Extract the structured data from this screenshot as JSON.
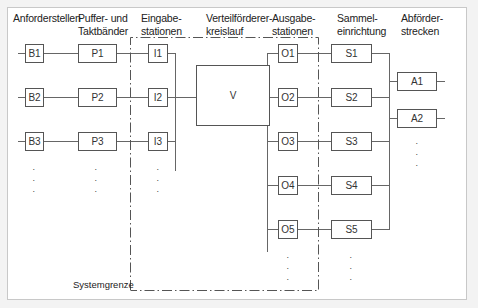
{
  "columns": [
    {
      "id": "anforderstellen",
      "label": "Anforderstellen"
    },
    {
      "id": "puffer",
      "label": "Puffer- und\nTaktbänder"
    },
    {
      "id": "eingabe",
      "label": "Eingabe-\nstationen"
    },
    {
      "id": "verteil",
      "label": "Verteilförderer-\nkreislauf"
    },
    {
      "id": "ausgabe",
      "label": "Ausgabe-\nstationen"
    },
    {
      "id": "sammel",
      "label": "Sammel-\neinrichtung"
    },
    {
      "id": "abfoerder",
      "label": "Abförder-\nstrecken"
    }
  ],
  "nodes": {
    "B": [
      "B1",
      "B2",
      "B3"
    ],
    "P": [
      "P1",
      "P2",
      "P3"
    ],
    "I": [
      "I1",
      "I2",
      "I3"
    ],
    "V": "V",
    "O": [
      "O1",
      "O2",
      "O3",
      "O4",
      "O5"
    ],
    "S": [
      "S1",
      "S2",
      "S3",
      "S4",
      "S5"
    ],
    "A": [
      "A1",
      "A2"
    ]
  },
  "continuation": ". \n. \n. ",
  "system_boundary_label": "Systemgrenze",
  "colors": {
    "line": "#666666",
    "box_border": "#555555",
    "frame": "#c8c8c8",
    "background": "#ffffff"
  }
}
